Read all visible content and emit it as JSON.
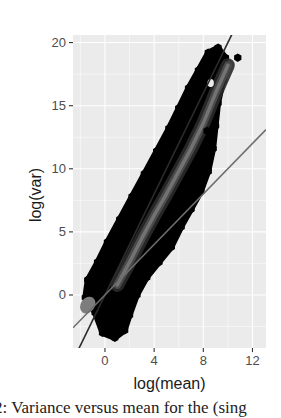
{
  "chart_data": {
    "type": "heatmap",
    "subtype": "hexbin scatter with reference lines",
    "title": "",
    "xlabel": "log(mean)",
    "ylabel": "log(var)",
    "xlim": [
      -2.6,
      13.1
    ],
    "ylim": [
      -4.2,
      20.6
    ],
    "x_ticks": [
      0,
      4,
      8,
      12
    ],
    "y_ticks": [
      0,
      5,
      10,
      15,
      20
    ],
    "grid": true,
    "legend": null,
    "panel_background": "#ebebeb",
    "grid_color": "#ffffff",
    "reference_lines": [
      {
        "name": "steep-line",
        "slope": 2.0,
        "intercept": 0.0,
        "color": "#2b2b2b"
      },
      {
        "name": "poisson-line",
        "slope": 1.0,
        "intercept": 0.0,
        "color": "#6e6e6e"
      }
    ],
    "density_ridge": [
      {
        "x": 1.0,
        "y": 0.8
      },
      {
        "x": 2.0,
        "y": 2.6
      },
      {
        "x": 3.0,
        "y": 4.5
      },
      {
        "x": 4.0,
        "y": 6.3
      },
      {
        "x": 5.0,
        "y": 8.0
      },
      {
        "x": 6.0,
        "y": 9.8
      },
      {
        "x": 7.0,
        "y": 11.6
      },
      {
        "x": 8.0,
        "y": 13.6
      },
      {
        "x": 9.0,
        "y": 16.0
      },
      {
        "x": 10.0,
        "y": 18.2
      }
    ],
    "cloud_outline": [
      [
        -1.4,
        1.2
      ],
      [
        -0.6,
        2.6
      ],
      [
        0.2,
        4.2
      ],
      [
        1.2,
        6.0
      ],
      [
        2.2,
        7.8
      ],
      [
        3.2,
        9.6
      ],
      [
        4.2,
        11.4
      ],
      [
        5.2,
        13.2
      ],
      [
        6.0,
        14.8
      ],
      [
        6.8,
        16.4
      ],
      [
        7.6,
        17.8
      ],
      [
        8.4,
        19.2
      ],
      [
        9.2,
        19.6
      ],
      [
        9.8,
        18.8
      ],
      [
        9.6,
        17.0
      ],
      [
        9.2,
        15.2
      ],
      [
        9.0,
        13.4
      ],
      [
        8.8,
        11.6
      ],
      [
        8.4,
        9.8
      ],
      [
        7.8,
        8.2
      ],
      [
        7.0,
        6.8
      ],
      [
        6.2,
        5.4
      ],
      [
        5.4,
        3.8
      ],
      [
        4.4,
        2.6
      ],
      [
        3.4,
        1.4
      ],
      [
        2.6,
        0.0
      ],
      [
        2.0,
        -1.6
      ],
      [
        1.6,
        -2.8
      ],
      [
        0.8,
        -3.4
      ],
      [
        -0.2,
        -3.0
      ],
      [
        -0.8,
        -1.4
      ],
      [
        -1.6,
        -0.2
      ]
    ],
    "outliers": [
      {
        "x": 10.8,
        "y": 18.8
      },
      {
        "x": 5.9,
        "y": 14.4
      },
      {
        "x": 8.3,
        "y": 13.0
      },
      {
        "x": 7.7,
        "y": 15.6
      }
    ],
    "color_low": "#000000",
    "color_high": "#7a7a7a"
  },
  "axes": {
    "x_tick_labels": [
      "0",
      "4",
      "8",
      "12"
    ],
    "y_tick_labels": [
      "0",
      "5",
      "10",
      "15",
      "20"
    ]
  },
  "caption": {
    "text": "2: Variance versus mean for the (sing"
  }
}
